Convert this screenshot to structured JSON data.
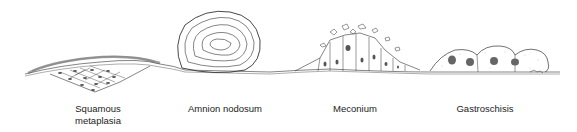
{
  "figure": {
    "labels": [
      {
        "text": "Squamous\nmetaplasia",
        "line1": "Squamous",
        "line2": "metaplasia"
      },
      {
        "text": "Amnion nodosum"
      },
      {
        "text": "Meconium"
      },
      {
        "text": "Gastroschisis"
      }
    ]
  }
}
